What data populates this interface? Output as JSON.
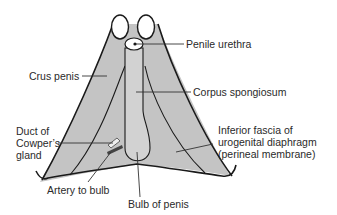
{
  "diagram": {
    "colors": {
      "fill_outer": "#c4c4c4",
      "fill_inner": "#cfcfcf",
      "stroke": "#1a1a1a",
      "text": "#2a2a2a",
      "background": "#ffffff"
    },
    "labels": {
      "penile_urethra": "Penile urethra",
      "crus_penis": "Crus penis",
      "corpus_spongiosum": "Corpus spongiosum",
      "duct_cowper_1": "Duct of",
      "duct_cowper_2": "Cowper’s",
      "duct_cowper_3": "gland",
      "inferior_fascia_1": "Inferior fascia of",
      "inferior_fascia_2": "urogenital diaphragm",
      "inferior_fascia_3": "(perineal membrane)",
      "artery_to_bulb": "Artery to bulb",
      "bulb_of_penis": "Bulb of penis"
    }
  }
}
